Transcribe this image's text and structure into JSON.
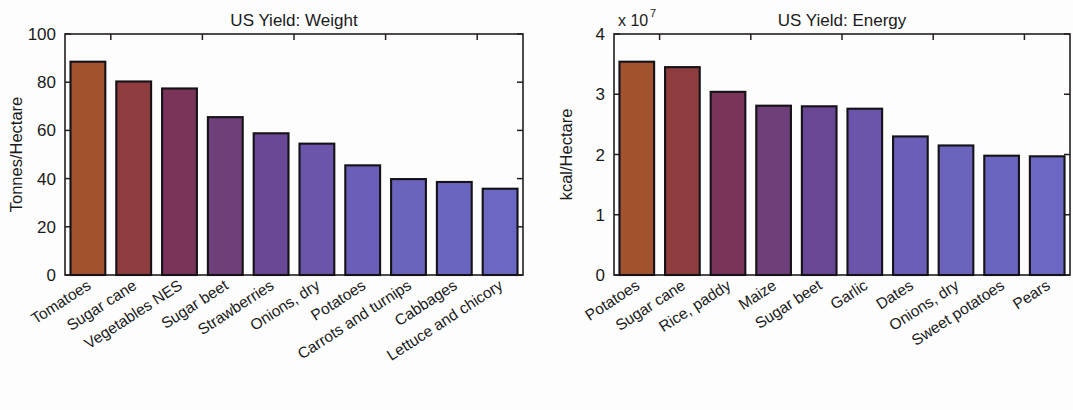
{
  "figure": {
    "background_color": "#fdfdfd",
    "ink_color": "#1a1a1a",
    "bar_edge_color": "#141216"
  },
  "chart_data": [
    {
      "type": "bar",
      "id": "us-yield-weight",
      "title": "US Yield: Weight",
      "xlabel": "",
      "ylabel": "Tonnes/Hectare",
      "ylim": [
        0,
        100
      ],
      "yticks": [
        0,
        20,
        40,
        60,
        80,
        100
      ],
      "ytick_labels": [
        "0",
        "20",
        "40",
        "60",
        "80",
        "100"
      ],
      "grid": false,
      "legend": "none",
      "multiplier": "",
      "categories": [
        "Tomatoes",
        "Sugar cane",
        "Vegetables NES",
        "Sugar beet",
        "Strawberries",
        "Onions, dry",
        "Potatoes",
        "Carrots and turnips",
        "Cabbages",
        "Lettuce and chicory"
      ],
      "values": [
        88.5,
        80.3,
        77.4,
        65.5,
        58.8,
        54.5,
        45.5,
        39.8,
        38.6,
        35.8
      ],
      "bar_colors": [
        "#a1532f",
        "#8e3c3d",
        "#7a3359",
        "#6f3f79",
        "#6a4795",
        "#6b55ab",
        "#6a5fb8",
        "#6a64bd",
        "#6a66c0",
        "#6a68c3"
      ]
    },
    {
      "type": "bar",
      "id": "us-yield-energy",
      "title": "US Yield: Energy",
      "xlabel": "",
      "ylabel": "kcal/Hectare",
      "ylim": [
        0,
        40000000
      ],
      "yticks": [
        0,
        10000000,
        20000000,
        30000000,
        40000000
      ],
      "ytick_labels": [
        "0",
        "1",
        "2",
        "3",
        "4"
      ],
      "grid": false,
      "legend": "none",
      "multiplier": "x 10",
      "multiplier_exponent": "7",
      "categories": [
        "Potatoes",
        "Sugar cane",
        "Rice, paddy",
        "Maize",
        "Sugar beet",
        "Garlic",
        "Dates",
        "Onions, dry",
        "Sweet potatoes",
        "Pears"
      ],
      "values": [
        35400000,
        34500000,
        30400000,
        28100000,
        28000000,
        27600000,
        23000000,
        21500000,
        19800000,
        19700000
      ],
      "bar_colors": [
        "#a1532f",
        "#8e3c3d",
        "#7a3359",
        "#6f3f79",
        "#6a4795",
        "#6b55ab",
        "#6a5fb8",
        "#6a64bd",
        "#6a66c0",
        "#6a68c3"
      ]
    }
  ]
}
